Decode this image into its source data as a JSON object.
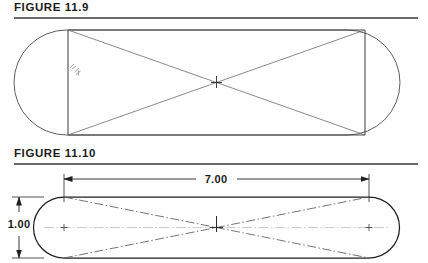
{
  "page": {
    "background_color": "#ffffff",
    "ink_color": "#333333",
    "rule_color": "#6a6a6a"
  },
  "figures": [
    {
      "id": "figure-11-9",
      "title": "FIGURE 11.9",
      "caption_rule": true,
      "shape": {
        "type": "slot",
        "description": "rounded-end slot (stadium) outline with inscribed rectangle and crossed diagonals",
        "outline_x_left": 14,
        "outline_x_right": 400,
        "outline_y_top": 8,
        "outline_y_bottom": 113,
        "rect_x_left": 68,
        "rect_x_right": 365
      },
      "construction": {
        "diagonals": 2,
        "center_mark": true,
        "center_mark_label": "+"
      },
      "annotation": {
        "present": true,
        "position": "left of inner vertical line",
        "text": ""
      }
    },
    {
      "id": "figure-11-10",
      "title": "FIGURE 11.10",
      "caption_rule": true,
      "shape": {
        "type": "slot",
        "description": "dimensioned rounded-end slot with dash-dot bowtie construction lines",
        "outline_x_left": 33,
        "outline_x_right": 400,
        "outline_y_top": 29,
        "outline_y_bottom": 90,
        "end_center_left_x": 64,
        "end_center_right_x": 369
      },
      "construction": {
        "linetype": "dash-dot",
        "center_marks": 3,
        "bowtie": true
      },
      "dimensions": [
        {
          "name": "overall-length",
          "value": "7.00",
          "orientation": "horizontal",
          "placement": "above",
          "arrowheads": "both",
          "from_x": 64,
          "to_x": 369
        },
        {
          "name": "overall-width",
          "value": "1.00",
          "orientation": "vertical",
          "placement": "left",
          "arrowheads": "both",
          "from_y": 29,
          "to_y": 90
        }
      ]
    }
  ]
}
